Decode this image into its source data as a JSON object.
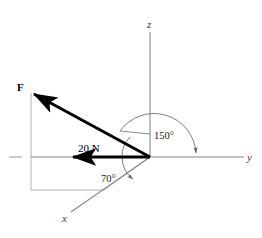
{
  "figure": {
    "background_color": "#ffffff"
  },
  "axes": {
    "x_label": "x",
    "y_label": "y",
    "z_label": "z",
    "axis_color": "#8a8a8a",
    "origin": {
      "x": 150,
      "y": 157
    },
    "z_tip": {
      "x": 150,
      "y": 30
    },
    "y_tip": {
      "x": 244,
      "y": 157
    },
    "x_tip": {
      "x": 70,
      "y": 213
    },
    "y_negative_tick": {
      "x": 10,
      "y": 157
    }
  },
  "vectors": {
    "force": {
      "label": "F",
      "color": "#000000",
      "tail": {
        "x": 150,
        "y": 157
      },
      "tip": {
        "x": 31,
        "y": 92
      },
      "label_pos": {
        "x": 18,
        "y": 90
      }
    },
    "projection": {
      "label": "20 N",
      "color": "#000000",
      "tail": {
        "x": 150,
        "y": 157
      },
      "tip": {
        "x": 70,
        "y": 157
      },
      "label_pos": {
        "x": 79,
        "y": 152
      }
    }
  },
  "angles": [
    {
      "name": "angle-150",
      "label": "150°",
      "value": 150,
      "unit": "degrees",
      "label_pos": {
        "x": 155,
        "y": 139
      },
      "from": "force vector",
      "to": "positive y axis"
    },
    {
      "name": "angle-70",
      "label": "70°",
      "value": 70,
      "unit": "degrees",
      "label_pos": {
        "x": 103,
        "y": 180
      },
      "from": "projection in x-y plane",
      "to": "positive x axis"
    }
  ],
  "construction": {
    "color": "#999999",
    "description": "thin gray projection lines forming rectangle from force tip to x-y plane"
  },
  "colors": {
    "vector_black": "#000000",
    "axis_gray": "#8a8a8a",
    "construction_gray": "#a0a0a0",
    "arc_gray": "#707070",
    "background": "#ffffff"
  }
}
